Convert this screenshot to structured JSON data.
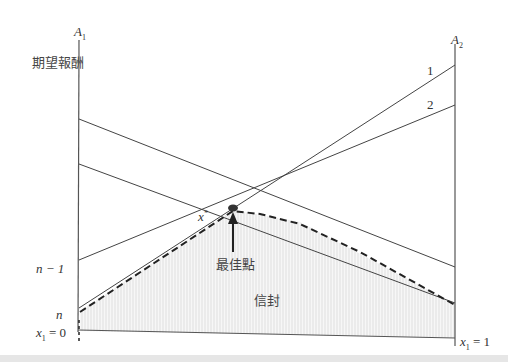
{
  "labels": {
    "y_axis_title": "期望報酬",
    "left_axis": "A",
    "left_axis_sub": "1",
    "right_axis": "A",
    "right_axis_sub": "2",
    "line1": "1",
    "line2": "2",
    "n_minus_1": "n − 1",
    "n": "n",
    "x_left": "x",
    "x_left_sub": "1",
    "x_left_eq": " = 0",
    "x_right": "x",
    "x_right_sub": "1",
    "x_right_eq": " = 1",
    "x_star": "x",
    "x_star_sup": "*",
    "optimal_point": "最佳點",
    "envelope": "信封"
  },
  "colors": {
    "line": "#444444",
    "envelope_fill": "#f2f2f2",
    "envelope_hatch": "#dddddd",
    "band": "#e6e6e6"
  },
  "lines": [
    {
      "name": "line-1",
      "x1": 79,
      "y1": 308,
      "x2": 455,
      "y2": 65
    },
    {
      "name": "line-2",
      "x1": 79,
      "y1": 260,
      "x2": 455,
      "y2": 105
    },
    {
      "name": "line-a",
      "x1": 79,
      "y1": 119,
      "x2": 455,
      "y2": 267
    },
    {
      "name": "line-b",
      "x1": 79,
      "y1": 164,
      "x2": 455,
      "y2": 303
    }
  ],
  "optimal_point": {
    "x": 233,
    "y": 208
  }
}
